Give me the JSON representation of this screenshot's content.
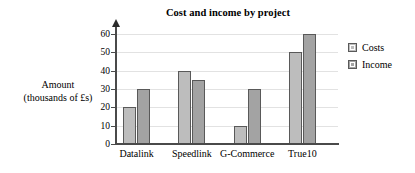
{
  "chart_data": {
    "type": "bar",
    "title": "Cost and income by project",
    "xlabel": "",
    "ylabel_line1": "Amount",
    "ylabel_line2": "(thousands of £s)",
    "categories": [
      "Datalink",
      "Speedlink",
      "G-Commerce",
      "True10"
    ],
    "series": [
      {
        "name": "Costs",
        "values": [
          20,
          40,
          10,
          50
        ],
        "color": "#bdbdbd"
      },
      {
        "name": "Income",
        "values": [
          30,
          35,
          30,
          60
        ],
        "color": "#a3a3a3"
      }
    ],
    "ylim": [
      0,
      60
    ],
    "yticks": [
      0,
      10,
      20,
      30,
      40,
      50,
      60
    ],
    "ytick_labels": [
      "0",
      "10",
      "20",
      "30",
      "40",
      "50",
      "60"
    ],
    "grid": true,
    "grid_axis": "y",
    "legend_position": "right",
    "axis_arrow": true
  },
  "legend": {
    "items": [
      {
        "label": "Costs"
      },
      {
        "label": "Income"
      }
    ]
  }
}
